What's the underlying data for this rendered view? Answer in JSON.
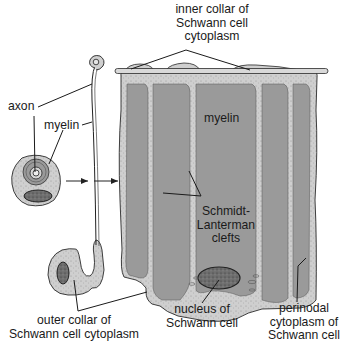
{
  "diagram": {
    "type": "anatomical illustration",
    "colors": {
      "myelin": "#9a9a9a",
      "cytoplasm": "#cfcfcf",
      "nucleus": "#707070",
      "outline": "#2a2a2a",
      "background": "#ffffff"
    },
    "labels": {
      "inner_collar": [
        "inner collar of",
        "Schwann cell",
        "cytoplasm"
      ],
      "axon": "axon",
      "myelin_small": "myelin",
      "myelin_main": "myelin",
      "schmidt_lanterman": [
        "Schmidt-",
        "Lanterman",
        "clefts"
      ],
      "outer_collar": [
        "outer collar of",
        "Schwann cell cytoplasm"
      ],
      "nucleus": [
        "nucleus of",
        "Schwann cell"
      ],
      "perinodal": [
        "perinodal",
        "cytoplasm of",
        "Schwann cell"
      ]
    },
    "arrows": [
      {
        "from": "cross-section",
        "to": "unrolling stage",
        "glyph": "arrow-right"
      },
      {
        "from": "unrolling stage",
        "to": "unrolled sheet",
        "glyph": "arrow-right"
      }
    ]
  }
}
